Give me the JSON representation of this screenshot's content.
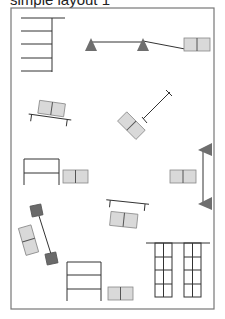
{
  "title": "simple layout 1",
  "diagram": {
    "type": "floor-plan-layout",
    "frame": {
      "x": 11,
      "y": 8,
      "width": 203,
      "height": 301
    },
    "elements": [
      {
        "kind": "shelf",
        "label": "shelf-top-left",
        "rows": 5
      },
      {
        "kind": "rope-with-triangles",
        "label": "top-stanchion-line",
        "triangles": 2
      },
      {
        "kind": "box-pair",
        "label": "top-right-boxes"
      },
      {
        "kind": "desk-with-boxes",
        "label": "tilted-desk-left"
      },
      {
        "kind": "desk-with-boxes",
        "label": "diagonal-desk-center"
      },
      {
        "kind": "table-frame",
        "label": "left-table"
      },
      {
        "kind": "box-pair",
        "label": "left-table-boxes"
      },
      {
        "kind": "box-pair",
        "label": "right-middle-boxes"
      },
      {
        "kind": "rope-with-triangles",
        "label": "right-vertical-stanchion",
        "triangles": 2
      },
      {
        "kind": "dark-post-pair",
        "label": "lower-left-posts"
      },
      {
        "kind": "box-stack",
        "label": "lower-left-boxes"
      },
      {
        "kind": "desk-with-boxes",
        "label": "lower-center-desk"
      },
      {
        "kind": "shelf",
        "label": "bottom-shelf",
        "rows": 3
      },
      {
        "kind": "box-pair",
        "label": "bottom-boxes"
      },
      {
        "kind": "grid-rack",
        "label": "bottom-right-racks",
        "columns": 2,
        "rows": 4
      }
    ]
  }
}
